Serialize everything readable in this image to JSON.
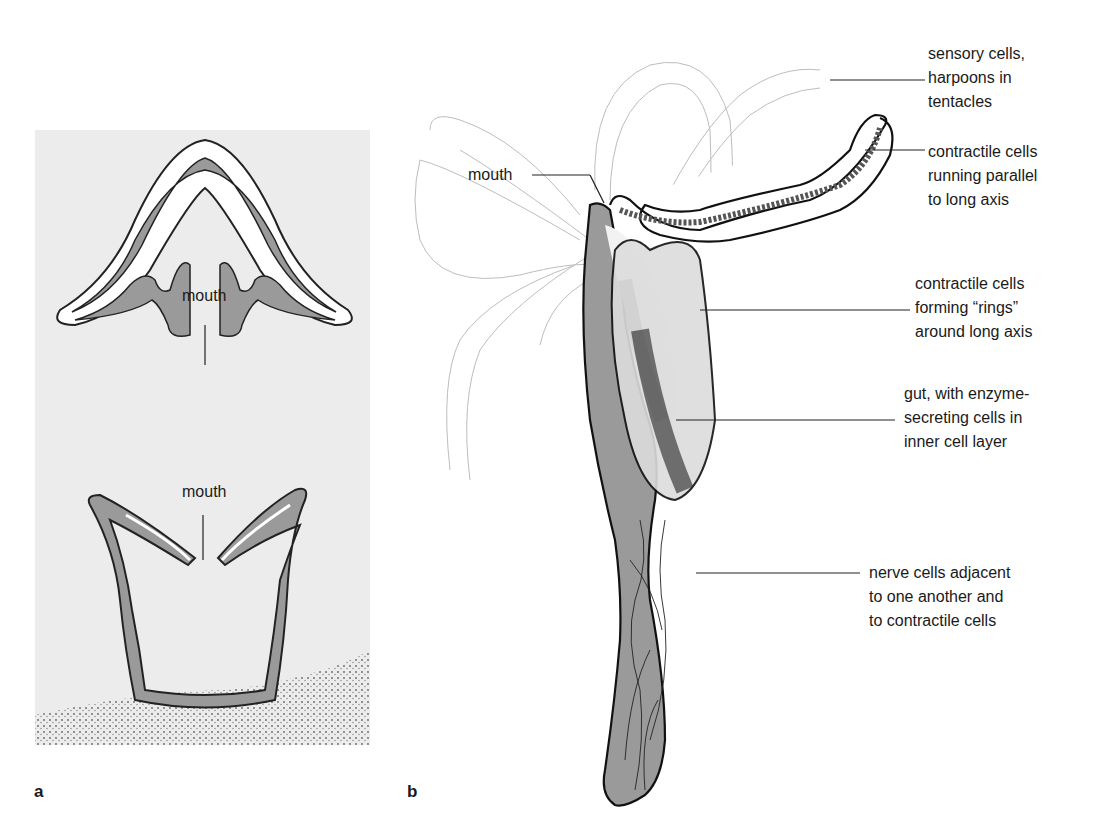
{
  "figure": {
    "panels": [
      {
        "id": "a",
        "panel_label": "a",
        "top_drawing": {
          "label": "mouth"
        },
        "bottom_drawing": {
          "label": "mouth"
        }
      },
      {
        "id": "b",
        "panel_label": "b",
        "labels": {
          "mouth": "mouth",
          "sensory": "sensory cells,\nharpoons in\ntentacles",
          "contractile_parallel": "contractile cells\nrunning parallel\nto long axis",
          "contractile_rings": "contractile cells\nforming “rings”\naround long axis",
          "gut": "gut, with enzyme-\nsecreting cells in\ninner cell layer",
          "nerve": "nerve cells adjacent\nto one another and\nto contractile cells"
        }
      }
    ],
    "colors": {
      "tissue_gray": "#9a9a9a",
      "background_wash": "#ececec",
      "ink": "#1a1a1a",
      "sediment": "#555555"
    }
  }
}
